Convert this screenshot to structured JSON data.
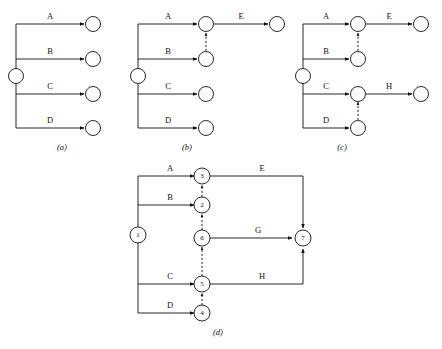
{
  "figure": {
    "title_strip_top": "",
    "title_strip_bottom": "",
    "captions": {
      "a": "(a)",
      "b": "(b)",
      "c": "(c)",
      "d": "(d)"
    }
  },
  "diagram_a": {
    "caption": "(a)",
    "activities": [
      "A",
      "B",
      "C",
      "D"
    ],
    "start_node": "",
    "end_nodes": [
      "",
      "",
      "",
      ""
    ],
    "dummy_links": []
  },
  "diagram_b": {
    "caption": "(b)",
    "activities": [
      "A",
      "B",
      "C",
      "D",
      "E"
    ],
    "dummy_links": [
      "B-node to A-node"
    ]
  },
  "diagram_c": {
    "caption": "(c)",
    "activities": [
      "A",
      "B",
      "C",
      "D",
      "E",
      "H"
    ],
    "dummy_links": [
      "B-node to A-node",
      "D-node to C-node"
    ]
  },
  "diagram_d": {
    "caption": "(d)",
    "nodes": [
      "1",
      "2",
      "3",
      "4",
      "5",
      "6",
      "7"
    ],
    "activities": [
      "A",
      "B",
      "C",
      "D",
      "E",
      "G",
      "H"
    ],
    "edges": [
      {
        "label": "A",
        "from": "1",
        "to": "3",
        "style": "solid"
      },
      {
        "label": "B",
        "from": "1",
        "to": "2",
        "style": "solid"
      },
      {
        "label": "C",
        "from": "1",
        "to": "5",
        "style": "solid"
      },
      {
        "label": "D",
        "from": "1",
        "to": "4",
        "style": "solid"
      },
      {
        "label": "E",
        "from": "3",
        "to": "7",
        "style": "solid"
      },
      {
        "label": "G",
        "from": "6",
        "to": "7",
        "style": "solid"
      },
      {
        "label": "H",
        "from": "5",
        "to": "7",
        "style": "solid"
      },
      {
        "label": "",
        "from": "2",
        "to": "3",
        "style": "dashed"
      },
      {
        "label": "",
        "from": "6",
        "to": "2",
        "style": "dashed"
      },
      {
        "label": "",
        "from": "5",
        "to": "6",
        "style": "dashed"
      },
      {
        "label": "",
        "from": "4",
        "to": "5",
        "style": "dashed"
      }
    ]
  },
  "labels": {
    "A": "A",
    "B": "B",
    "C": "C",
    "D": "D",
    "E": "E",
    "G": "G",
    "H": "H",
    "n1": "1",
    "n2": "2",
    "n3": "3",
    "n4": "4",
    "n5": "5",
    "n6": "6",
    "n7": "7"
  },
  "colors": {
    "ink": "#111111",
    "paper": "#ffffff",
    "faint": "#c9c9cf"
  }
}
